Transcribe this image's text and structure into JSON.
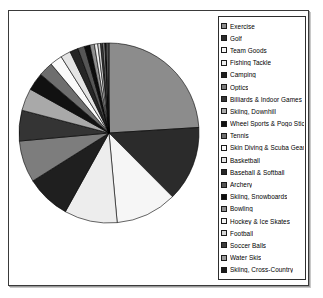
{
  "chart_data": {
    "type": "pie",
    "title": "",
    "legend_position": "right",
    "categories": [
      "Exercise",
      "Golf",
      "Team Goods",
      "Fishing Tackle",
      "Camping",
      "Optics",
      "Billiards & Indoor Games",
      "Skiing, Downhill",
      "Wheel Sports & Pogo Sticks",
      "Tennis",
      "Skin Diving & Scuba Gear",
      "Basketball",
      "Baseball & Softball",
      "Archery",
      "Skiing, Snowboards",
      "Bowling",
      "Hockey & Ice Skates",
      "Football",
      "Soccer Balls",
      "Water Skis",
      "Skiing, Cross-Country",
      "Volleyball & Badminton Sets",
      "Racquetball"
    ],
    "values": [
      24.0,
      13.5,
      11.0,
      9.5,
      8.0,
      7.5,
      5.5,
      4.0,
      3.2,
      2.6,
      2.2,
      1.8,
      1.5,
      1.2,
      1.0,
      0.8,
      0.6,
      0.5,
      0.4,
      0.35,
      0.3,
      0.25,
      0.2
    ],
    "colors": [
      "#8c8c8c",
      "#2b2b2b",
      "#f6f6f6",
      "#ededed",
      "#1f1f1f",
      "#7d7d7d",
      "#343434",
      "#a9a9a9",
      "#111111",
      "#6e6e6e",
      "#fafafa",
      "#e4e4e4",
      "#262626",
      "#555555",
      "#0d0d0d",
      "#8f8f8f",
      "#f2f2f2",
      "#d6d6d6",
      "#3c3c3c",
      "#9c9c9c",
      "#1a1a1a",
      "#c2c2c2",
      "#5c5c5c"
    ],
    "slice_border": "#000000",
    "start_angle_deg": 0,
    "direction": "clockwise"
  },
  "legend": {
    "items": [
      {
        "label": "Exercise",
        "swatch": "#8c8c8c"
      },
      {
        "label": "Golf",
        "swatch": "#2b2b2b"
      },
      {
        "label": "Team Goods",
        "swatch": "#f6f6f6"
      },
      {
        "label": "Fishing Tackle",
        "swatch": "#ededed"
      },
      {
        "label": "Camping",
        "swatch": "#1f1f1f"
      },
      {
        "label": "Optics",
        "swatch": "#7d7d7d"
      },
      {
        "label": "Billiards & Indoor Games",
        "swatch": "#343434"
      },
      {
        "label": "Skiing, Downhill",
        "swatch": "#a9a9a9"
      },
      {
        "label": "Wheel Sports & Pogo Sticks",
        "swatch": "#111111"
      },
      {
        "label": "Tennis",
        "swatch": "#6e6e6e"
      },
      {
        "label": "Skin Diving & Scuba Gear",
        "swatch": "#fafafa"
      },
      {
        "label": "Basketball",
        "swatch": "#e4e4e4"
      },
      {
        "label": "Baseball & Softball",
        "swatch": "#262626"
      },
      {
        "label": "Archery",
        "swatch": "#555555"
      },
      {
        "label": "Skiing, Snowboards",
        "swatch": "#0d0d0d"
      },
      {
        "label": "Bowling",
        "swatch": "#8f8f8f"
      },
      {
        "label": "Hockey & Ice Skates",
        "swatch": "#f2f2f2"
      },
      {
        "label": "Football",
        "swatch": "#d6d6d6"
      },
      {
        "label": "Soccer Balls",
        "swatch": "#3c3c3c"
      },
      {
        "label": "Water Skis",
        "swatch": "#9c9c9c"
      },
      {
        "label": "Skiing, Cross-Country",
        "swatch": "#1a1a1a"
      },
      {
        "label": "Volleyball & Badminton Sets",
        "swatch": "#c2c2c2"
      },
      {
        "label": "Racquetball",
        "swatch": "#5c5c5c"
      }
    ]
  }
}
